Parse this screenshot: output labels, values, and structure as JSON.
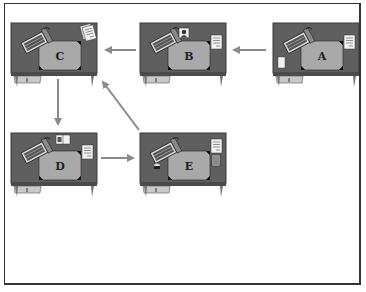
{
  "diagram": {
    "type": "flow",
    "colors": {
      "desk_surface": "#5f5f5f",
      "desk_edge": "#3a3a3a",
      "blotter": "#a9a9a9",
      "arrow": "#8a8a8a",
      "frame": "#333333"
    },
    "nodes": [
      {
        "id": "A",
        "label": "A",
        "items": [
          "keyboard",
          "document",
          "notepad"
        ]
      },
      {
        "id": "B",
        "label": "B",
        "items": [
          "keyboard",
          "photo-frame",
          "document"
        ]
      },
      {
        "id": "C",
        "label": "C",
        "items": [
          "keyboard",
          "document-stack"
        ]
      },
      {
        "id": "D",
        "label": "D",
        "items": [
          "keyboard",
          "book",
          "document"
        ]
      },
      {
        "id": "E",
        "label": "E",
        "items": [
          "keyboard",
          "coffee-mug",
          "document",
          "pencil-cup"
        ]
      }
    ],
    "edges": [
      {
        "from": "A",
        "to": "B"
      },
      {
        "from": "B",
        "to": "C"
      },
      {
        "from": "C",
        "to": "D"
      },
      {
        "from": "D",
        "to": "E"
      },
      {
        "from": "E",
        "to": "C"
      }
    ]
  }
}
